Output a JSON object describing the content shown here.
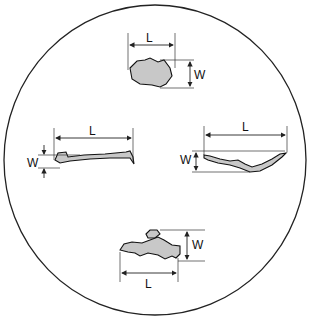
{
  "diagram": {
    "border_color": "#222222",
    "particle_fill": "#c8c8c8",
    "particles": [
      {
        "id": "top",
        "shape": "irregular-blob",
        "length_label": "L",
        "width_label": "W"
      },
      {
        "id": "left",
        "shape": "thin-flat-sliver",
        "length_label": "L",
        "width_label": "W"
      },
      {
        "id": "right",
        "shape": "curved-sliver",
        "length_label": "L",
        "width_label": "W"
      },
      {
        "id": "bottom",
        "shape": "blob-with-fragment",
        "length_label": "L",
        "width_label": "W"
      }
    ]
  }
}
